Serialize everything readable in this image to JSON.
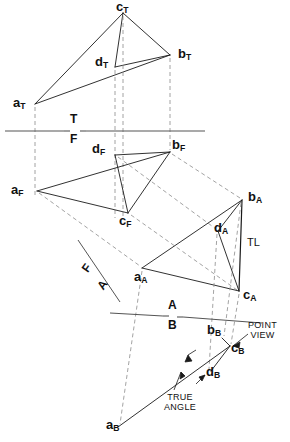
{
  "figure": {
    "type": "descriptive-geometry-orthographic-projection",
    "views": [
      {
        "id": "T",
        "name": "top-view",
        "fold_label_above": "T",
        "fold_label_below": "F"
      },
      {
        "id": "F",
        "name": "front-view"
      },
      {
        "id": "A",
        "name": "auxiliary-view-a"
      },
      {
        "id": "B",
        "name": "auxiliary-view-b"
      }
    ],
    "points": [
      {
        "key": "aT",
        "letter": "a",
        "sub": "T",
        "x": 35,
        "y": 104,
        "label_x": 13,
        "label_y": 96
      },
      {
        "key": "bT",
        "letter": "b",
        "sub": "T",
        "x": 170,
        "y": 55,
        "label_x": 178,
        "label_y": 47
      },
      {
        "key": "cT",
        "letter": "c",
        "sub": "T",
        "x": 123,
        "y": 13,
        "label_x": 117,
        "label_y": -1
      },
      {
        "key": "dT",
        "letter": "d",
        "sub": "T",
        "x": 115,
        "y": 67,
        "label_x": 96,
        "label_y": 55
      },
      {
        "key": "aF",
        "letter": "a",
        "sub": "F",
        "x": 37,
        "y": 191,
        "label_x": 12,
        "label_y": 183
      },
      {
        "key": "bF",
        "letter": "b",
        "sub": "F",
        "x": 170,
        "y": 152,
        "label_x": 173,
        "label_y": 138
      },
      {
        "key": "cF",
        "letter": "c",
        "sub": "F",
        "x": 128,
        "y": 213,
        "label_x": 120,
        "label_y": 214
      },
      {
        "key": "dF",
        "letter": "d",
        "sub": "F",
        "x": 115,
        "y": 155,
        "label_x": 93,
        "label_y": 143
      },
      {
        "key": "aA",
        "letter": "a",
        "sub": "A",
        "x": 142,
        "y": 268,
        "label_x": 136,
        "label_y": 270
      },
      {
        "key": "bA",
        "letter": "b",
        "sub": "A",
        "x": 242,
        "y": 200,
        "label_x": 248,
        "label_y": 190
      },
      {
        "key": "cA",
        "letter": "c",
        "sub": "A",
        "x": 239,
        "y": 291,
        "label_x": 244,
        "label_y": 288
      },
      {
        "key": "dA",
        "letter": "d",
        "sub": "A",
        "x": 218,
        "y": 231,
        "label_x": 215,
        "label_y": 222
      },
      {
        "key": "aB",
        "letter": "a",
        "sub": "B",
        "x": 118,
        "y": 427,
        "label_x": 108,
        "label_y": 419
      },
      {
        "key": "bB",
        "letter": "b",
        "sub": "B",
        "x": 222,
        "y": 338,
        "label_x": 209,
        "label_y": 324
      },
      {
        "key": "cB",
        "letter": "c",
        "sub": "B",
        "x": 230,
        "y": 346,
        "label_x": 232,
        "label_y": 340
      },
      {
        "key": "dB",
        "letter": "d",
        "sub": "B",
        "x": 211,
        "y": 371,
        "label_x": 208,
        "label_y": 366
      }
    ],
    "fold_lines": [
      {
        "id": "TF",
        "above": "T",
        "below": "F",
        "x1": 5,
        "y1": 131,
        "x2": 205,
        "y2": 131,
        "label_x": 68,
        "label_above_y": 113,
        "label_below_y": 131
      },
      {
        "id": "FA",
        "above": "F",
        "below": "A",
        "x1": 78,
        "y1": 240,
        "x2": 120,
        "y2": 302,
        "label_above_x": 86,
        "label_above_y": 268,
        "label_below_x": 99,
        "label_below_y": 283
      },
      {
        "id": "AB",
        "above": "A",
        "below": "B",
        "x1": 110,
        "y1": 313,
        "x2": 262,
        "y2": 323,
        "label_x": 171,
        "label_above_y": 300,
        "label_below_y": 318
      }
    ],
    "annotations": [
      {
        "id": "true-length",
        "text": "TL",
        "x": 247,
        "y": 243
      },
      {
        "id": "point-view",
        "text": "POINT\nVIEW",
        "line1": "POINT",
        "line2": "VIEW",
        "x": 252,
        "y": 329
      },
      {
        "id": "true-angle",
        "text": "TRUE\nANGLE",
        "line1": "TRUE",
        "line2": "ANGLE",
        "x": 176,
        "y": 398
      }
    ],
    "colors": {
      "ink": "#1a1a1a",
      "hidden": "#8c8c8c",
      "fold": "#555555"
    }
  }
}
